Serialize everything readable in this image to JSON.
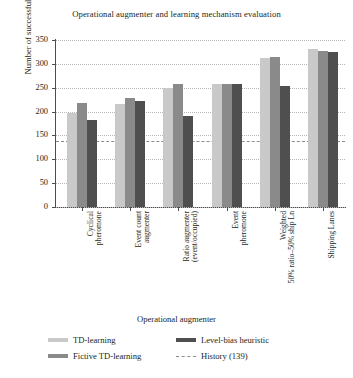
{
  "chart_data": {
    "type": "bar",
    "title": "Operational augmenter and learning mechanism evaluation",
    "xlabel": "Operational augmenter",
    "ylabel": "Number of successful events",
    "ylim": [
      0,
      350
    ],
    "yticks": [
      0,
      50,
      100,
      150,
      200,
      250,
      300,
      350
    ],
    "ytick_labels": [
      "0",
      "50",
      "100",
      "150",
      "200",
      "250",
      "300",
      "350"
    ],
    "grid": true,
    "legend_position": "bottom",
    "categories": [
      "Cyclical\npheromone",
      "Event count\naugmenter",
      "Ratio augmenter\n(event/occupied)",
      "Event\npheromone",
      "Weighted\n50% ratio–50% ship Ln",
      "Shipping Lanes"
    ],
    "series": [
      {
        "name": "TD-learning",
        "color": "#c9c9c9",
        "values": [
          197,
          215,
          249,
          257,
          313,
          331
        ]
      },
      {
        "name": "Fictive TD-learning",
        "color": "#8a8a8a",
        "values": [
          217,
          228,
          257,
          258,
          315,
          328
        ]
      },
      {
        "name": "Level-bias heuristic",
        "color": "#4f4f4f",
        "values": [
          182,
          222,
          190,
          257,
          253,
          325
        ]
      }
    ],
    "reference_line": {
      "name": "History (139)",
      "value": 139,
      "style": "dashed",
      "color": "#8c8c8c"
    }
  },
  "legend": {
    "entries": [
      {
        "label": "TD-learning",
        "icon": "legend-swatch-light"
      },
      {
        "label": "Level-bias heuristic",
        "icon": "legend-swatch-dark"
      },
      {
        "label": "Fictive TD-learning",
        "icon": "legend-swatch-medium"
      },
      {
        "label": "History (139)",
        "icon": "legend-swatch-dashed"
      }
    ]
  }
}
